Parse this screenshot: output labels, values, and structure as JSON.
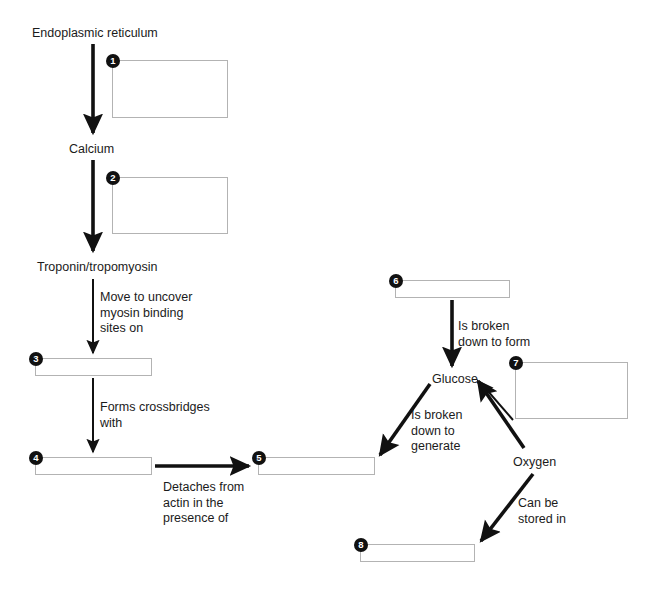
{
  "diagram": {
    "canvas": {
      "width": 656,
      "height": 590
    },
    "colors": {
      "text": "#1b1b1b",
      "arrow": "#111111",
      "box_border": "#b3b3b3",
      "marker_fill": "#111111",
      "marker_text": "#ffffff",
      "background": "#ffffff"
    },
    "node_labels": [
      {
        "id": "endoplasmic-reticulum",
        "text": "Endoplasmic reticulum",
        "x": 32,
        "y": 26
      },
      {
        "id": "calcium",
        "text": "Calcium",
        "x": 69,
        "y": 142
      },
      {
        "id": "troponin-tropomyosin",
        "text": "Troponin/tropomyosin",
        "x": 37,
        "y": 260
      },
      {
        "id": "glucose",
        "text": "Glucose",
        "x": 432,
        "y": 372
      },
      {
        "id": "oxygen",
        "text": "Oxygen",
        "x": 513,
        "y": 455
      }
    ],
    "edge_labels": [
      {
        "id": "move-to-uncover",
        "text": "Move to uncover\nmyosin binding\nsites on",
        "x": 100,
        "y": 290
      },
      {
        "id": "forms-crossbridges",
        "text": "Forms crossbridges\nwith",
        "x": 100,
        "y": 400
      },
      {
        "id": "detaches-from-actin",
        "text": "Detaches from\nactin in the\npresence of",
        "x": 163,
        "y": 480
      },
      {
        "id": "is-broken-down-to-form",
        "text": "Is broken\ndown to form",
        "x": 458,
        "y": 319
      },
      {
        "id": "is-broken-down-to-generate",
        "text": "Is broken\ndown to\ngenerate",
        "x": 411,
        "y": 408
      },
      {
        "id": "can-be-stored-in",
        "text": "Can be\nstored in",
        "x": 518,
        "y": 496
      }
    ],
    "answer_boxes": [
      {
        "number": "1",
        "x": 112,
        "y": 60,
        "width": 116,
        "height": 58,
        "marker_x": 106,
        "marker_y": 54
      },
      {
        "number": "2",
        "x": 112,
        "y": 177,
        "width": 116,
        "height": 57,
        "marker_x": 106,
        "marker_y": 171
      },
      {
        "number": "3",
        "x": 35,
        "y": 358,
        "width": 117,
        "height": 18,
        "marker_x": 29,
        "marker_y": 352
      },
      {
        "number": "4",
        "x": 35,
        "y": 457,
        "width": 117,
        "height": 18,
        "marker_x": 29,
        "marker_y": 451
      },
      {
        "number": "5",
        "x": 258,
        "y": 457,
        "width": 117,
        "height": 18,
        "marker_x": 252,
        "marker_y": 451
      },
      {
        "number": "6",
        "x": 395,
        "y": 280,
        "width": 115,
        "height": 18,
        "marker_x": 389,
        "marker_y": 274
      },
      {
        "number": "7",
        "x": 515,
        "y": 362,
        "width": 113,
        "height": 57,
        "marker_x": 509,
        "marker_y": 356
      },
      {
        "number": "8",
        "x": 360,
        "y": 544,
        "width": 115,
        "height": 18,
        "marker_x": 354,
        "marker_y": 538
      }
    ],
    "arrows": [
      {
        "id": "er-to-calcium",
        "from": "Endoplasmic reticulum",
        "to": "Calcium",
        "x1": 93,
        "y1": 44,
        "x2": 93,
        "y2": 133,
        "thick": true
      },
      {
        "id": "calcium-to-troponin",
        "from": "Calcium",
        "to": "Troponin/tropomyosin",
        "x1": 93,
        "y1": 160,
        "x2": 93,
        "y2": 251,
        "thick": true
      },
      {
        "id": "troponin-to-box3",
        "from": "Troponin/tropomyosin",
        "to": "Box 3",
        "x1": 93,
        "y1": 279,
        "x2": 93,
        "y2": 353,
        "thick": false
      },
      {
        "id": "box3-to-box4",
        "from": "Box 3",
        "to": "Box 4",
        "x1": 93,
        "y1": 378,
        "x2": 93,
        "y2": 452,
        "thick": false
      },
      {
        "id": "box4-to-box5",
        "from": "Box 4",
        "to": "Box 5",
        "x1": 155,
        "y1": 466,
        "x2": 249,
        "y2": 466,
        "thick": true
      },
      {
        "id": "box6-to-glucose",
        "from": "Box 6",
        "to": "Glucose",
        "x1": 452,
        "y1": 300,
        "x2": 452,
        "y2": 366,
        "thick": true
      },
      {
        "id": "glucose-to-box5",
        "from": "Glucose",
        "to": "Box 5",
        "x1": 430,
        "y1": 384,
        "x2": 380,
        "y2": 455,
        "thick": true
      },
      {
        "id": "oxygen-to-glucose",
        "from": "Oxygen",
        "to": "Glucose",
        "x1": 524,
        "y1": 448,
        "x2": 478,
        "y2": 381,
        "thick": true
      },
      {
        "id": "oxygen-to-box8",
        "from": "Oxygen",
        "to": "Box 8",
        "x1": 533,
        "y1": 474,
        "x2": 481,
        "y2": 541,
        "thick": true
      },
      {
        "id": "box7-to-glucose",
        "from": "Box 7",
        "to": "Glucose",
        "x1": 513,
        "y1": 420,
        "x2": 480,
        "y2": 382,
        "thick": false
      }
    ]
  }
}
